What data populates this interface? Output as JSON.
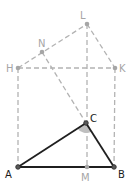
{
  "diagram": {
    "type": "geometry-construction",
    "points": {
      "L": {
        "label": "L",
        "x": 87,
        "y": 24
      },
      "N": {
        "label": "N",
        "x": 42,
        "y": 52
      },
      "H": {
        "label": "H",
        "x": 18,
        "y": 68
      },
      "K": {
        "label": "K",
        "x": 115,
        "y": 68
      },
      "C": {
        "label": "C",
        "x": 86,
        "y": 123
      },
      "A": {
        "label": "A",
        "x": 18,
        "y": 167
      },
      "M": {
        "label": "M",
        "x": 87,
        "y": 167
      },
      "B": {
        "label": "B",
        "x": 114,
        "y": 167
      }
    },
    "solid_segments": [
      "A-C",
      "C-B",
      "A-B"
    ],
    "dashed_segments": [
      "H-L",
      "L-K",
      "H-K",
      "H-A",
      "K-B",
      "L-M",
      "N-C"
    ],
    "angle_marker": "at C, angle ACB (shaded)",
    "colors": {
      "solid_line": "#1f1f1f",
      "dashed_line": "#b3b3b3",
      "gray_label": "#a6a6a6",
      "dark_label": "#1a1a1a",
      "angle_fill": "#bfbfbf"
    }
  }
}
